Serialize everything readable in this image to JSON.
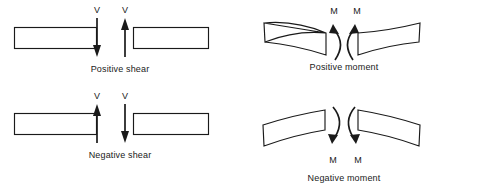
{
  "figure": {
    "background_color": "#ffffff",
    "ink_color": "#1a1a1a",
    "panels": [
      {
        "id": "positive-shear",
        "caption": "Positive shear",
        "force_symbol": "V",
        "left_label": "V",
        "right_label": "V",
        "left_arrow_direction": "down",
        "right_arrow_direction": "up",
        "beam_style": "straight"
      },
      {
        "id": "negative-shear",
        "caption": "Negative shear",
        "force_symbol": "V",
        "left_label": "V",
        "right_label": "V",
        "left_arrow_direction": "up",
        "right_arrow_direction": "down",
        "beam_style": "straight"
      },
      {
        "id": "positive-moment",
        "caption": "Positive moment",
        "force_symbol": "M",
        "left_label": "M",
        "right_label": "M",
        "left_arrow_direction": "counterclockwise",
        "right_arrow_direction": "clockwise",
        "beam_style": "sagging",
        "label_position": "above"
      },
      {
        "id": "negative-moment",
        "caption": "Negative moment",
        "force_symbol": "M",
        "left_label": "M",
        "right_label": "M",
        "left_arrow_direction": "clockwise",
        "right_arrow_direction": "counterclockwise",
        "beam_style": "hogging",
        "label_position": "below"
      }
    ]
  }
}
